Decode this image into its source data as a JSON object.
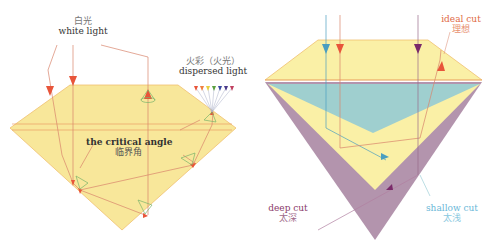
{
  "colors": {
    "gem_yellow": "#f8e79a",
    "gem_yellow_light": "#faf0a6",
    "gem_edge": "#f0c070",
    "ray_red": "#e8553a",
    "ray_line": "#d9846b",
    "teal": "#9fcfcf",
    "purple": "#b394ad",
    "purple_ray": "#7a2a6a",
    "blue_ray": "#4a9ec0",
    "cone_green": "#7ab36a",
    "label_dark": "#333333",
    "label_gray": "#777777",
    "label_red": "#e06a45",
    "label_purple": "#8a3a6a",
    "label_teal": "#6ab8d8"
  },
  "left_diagram": {
    "white_light": {
      "zh": "白光",
      "en": "white light"
    },
    "dispersed_light": {
      "zh": "火彩（火光）",
      "en": "dispersed light"
    },
    "critical_angle": {
      "en": "the critical angle",
      "zh": "临界角"
    },
    "spectrum_arrows": [
      "#e8553a",
      "#f08040",
      "#e8d040",
      "#5aa040",
      "#3a4aa0",
      "#4a3a8a",
      "#c04060"
    ]
  },
  "right_diagram": {
    "ideal_cut": {
      "en": "ideal cut",
      "zh": "理想"
    },
    "deep_cut": {
      "en": "deep cut",
      "zh": "太深"
    },
    "shallow_cut": {
      "en": "shallow cut",
      "zh": "太浅"
    }
  }
}
